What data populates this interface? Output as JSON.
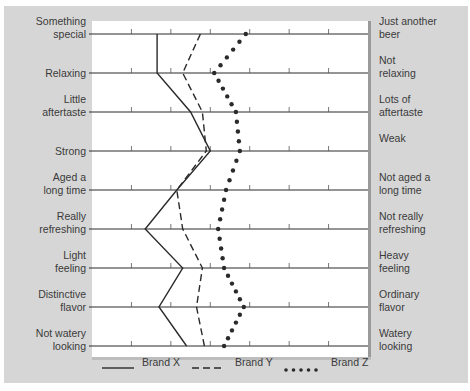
{
  "chart_data": {
    "type": "line",
    "title": "",
    "orientation": "horizontal semantic-differential profile",
    "scale": {
      "min": 0,
      "max": 7,
      "ticks": [
        1,
        2,
        3,
        4,
        5,
        6
      ]
    },
    "attributes": [
      {
        "left": "Something\nspecial",
        "right": "Just another\nbeer"
      },
      {
        "left": "Relaxing",
        "right": "Not\nrelaxing"
      },
      {
        "left": "Little\naftertaste",
        "right": "Lots of\naftertaste"
      },
      {
        "left": "Strong",
        "right": "Weak"
      },
      {
        "left": "Aged a\nlong time",
        "right": "Not aged a\nlong time"
      },
      {
        "left": "Really\nrefreshing",
        "right": "Not really\nrefreshing"
      },
      {
        "left": "Light\nfeeling",
        "right": "Heavy\nfeeling"
      },
      {
        "left": "Distinctive\nflavor",
        "right": "Ordinary\nflavor"
      },
      {
        "left": "Not watery\nlooking",
        "right": "Watery\nlooking"
      }
    ],
    "series": [
      {
        "name": "Brand X",
        "style": "solid",
        "values": [
          1.65,
          1.65,
          2.5,
          3.0,
          2.15,
          1.35,
          2.3,
          1.7,
          2.4
        ]
      },
      {
        "name": "Brand Y",
        "style": "dashed",
        "values": [
          2.75,
          2.3,
          2.8,
          2.9,
          2.15,
          2.3,
          2.8,
          2.65,
          2.85
        ]
      },
      {
        "name": "Brand Z",
        "style": "dotted",
        "values": [
          3.9,
          3.1,
          3.65,
          3.75,
          3.4,
          3.2,
          3.35,
          3.85,
          3.35
        ]
      }
    ],
    "legend": {
      "placement": "bottom",
      "entries": [
        "Brand X",
        "Brand Y",
        "Brand Z"
      ]
    },
    "colors": {
      "panel": "#d6d6d6",
      "plot": "#ffffff",
      "ink": "#2a2a2a"
    }
  }
}
